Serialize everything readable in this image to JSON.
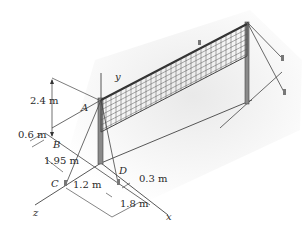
{
  "figure": {
    "colors": {
      "line": "#444444",
      "pole": "#6a6a6a",
      "net": "#555555",
      "shadow": "#e8e8e8"
    }
  },
  "axes": {
    "x": "x",
    "y": "y",
    "z": "z"
  },
  "points": {
    "A": "A",
    "B": "B",
    "C": "C",
    "D": "D"
  },
  "dimensions": {
    "height_A": "2.4 m",
    "offset_B": "0.6 m",
    "dist_z_C": "1.95 m",
    "dist_C_x": "1.2 m",
    "dist_D": "0.3 m",
    "dist_x": "1.8 m"
  }
}
